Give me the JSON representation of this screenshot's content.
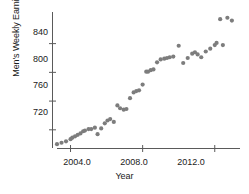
{
  "chart_data": {
    "type": "scatter",
    "title": "",
    "xlabel": "Year",
    "ylabel": "Men's Weekly Earnings",
    "xlim": [
      2003.0,
      2013.4
    ],
    "ylim": [
      694,
      884
    ],
    "grid": false,
    "legend": null,
    "marker_color": "#7d7d7d",
    "axis_color": "#5a5a5a",
    "xticks": [
      2004.0,
      2008.0,
      2012.0
    ],
    "xtick_labels": [
      "2004.0",
      "2008.0",
      "2012.0"
    ],
    "yticks": [
      720,
      760,
      800,
      840
    ],
    "ytick_labels": [
      "720",
      "760",
      "800",
      "840"
    ],
    "points": [
      {
        "x": 2003.25,
        "y": 700
      },
      {
        "x": 2003.5,
        "y": 702
      },
      {
        "x": 2003.75,
        "y": 704
      },
      {
        "x": 2004.0,
        "y": 707
      },
      {
        "x": 2004.1,
        "y": 709
      },
      {
        "x": 2004.25,
        "y": 711
      },
      {
        "x": 2004.4,
        "y": 713
      },
      {
        "x": 2004.55,
        "y": 715
      },
      {
        "x": 2004.7,
        "y": 718
      },
      {
        "x": 2004.8,
        "y": 719
      },
      {
        "x": 2005.0,
        "y": 721
      },
      {
        "x": 2005.15,
        "y": 721
      },
      {
        "x": 2005.35,
        "y": 723
      },
      {
        "x": 2005.5,
        "y": 714
      },
      {
        "x": 2005.7,
        "y": 722
      },
      {
        "x": 2005.9,
        "y": 729
      },
      {
        "x": 2006.05,
        "y": 733
      },
      {
        "x": 2006.2,
        "y": 735
      },
      {
        "x": 2006.4,
        "y": 731
      },
      {
        "x": 2006.6,
        "y": 754
      },
      {
        "x": 2006.75,
        "y": 750
      },
      {
        "x": 2006.95,
        "y": 748
      },
      {
        "x": 2007.1,
        "y": 749
      },
      {
        "x": 2007.3,
        "y": 764
      },
      {
        "x": 2007.5,
        "y": 772
      },
      {
        "x": 2007.65,
        "y": 774
      },
      {
        "x": 2007.8,
        "y": 775
      },
      {
        "x": 2008.0,
        "y": 783
      },
      {
        "x": 2008.2,
        "y": 801
      },
      {
        "x": 2008.3,
        "y": 801
      },
      {
        "x": 2008.45,
        "y": 803
      },
      {
        "x": 2008.6,
        "y": 804
      },
      {
        "x": 2008.8,
        "y": 814
      },
      {
        "x": 2009.0,
        "y": 818
      },
      {
        "x": 2009.2,
        "y": 819
      },
      {
        "x": 2009.35,
        "y": 820
      },
      {
        "x": 2009.5,
        "y": 821
      },
      {
        "x": 2009.7,
        "y": 822
      },
      {
        "x": 2010.0,
        "y": 837
      },
      {
        "x": 2010.25,
        "y": 813
      },
      {
        "x": 2010.5,
        "y": 820
      },
      {
        "x": 2010.75,
        "y": 826
      },
      {
        "x": 2010.9,
        "y": 828
      },
      {
        "x": 2011.05,
        "y": 825
      },
      {
        "x": 2011.25,
        "y": 821
      },
      {
        "x": 2011.5,
        "y": 829
      },
      {
        "x": 2011.75,
        "y": 833
      },
      {
        "x": 2012.0,
        "y": 838
      },
      {
        "x": 2012.1,
        "y": 841
      },
      {
        "x": 2012.3,
        "y": 874
      },
      {
        "x": 2012.45,
        "y": 838
      },
      {
        "x": 2012.7,
        "y": 876
      },
      {
        "x": 2012.95,
        "y": 872
      }
    ]
  }
}
